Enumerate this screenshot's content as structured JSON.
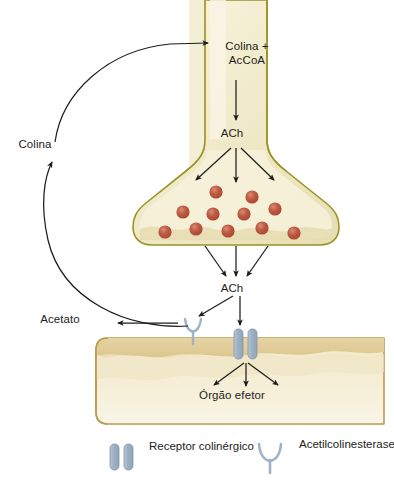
{
  "figure": {
    "language": "pt-BR"
  },
  "labels": {
    "colina_accoa_line1": "Colina +",
    "colina_accoa_line2": "AcCoA",
    "ach_terminal": "ACh",
    "ach_cleft": "ACh",
    "colina": "Colina",
    "acetato": "Acetato",
    "orgao_efetor": "Órgão efetor"
  },
  "legend": {
    "items": [
      {
        "icon": "receptor-bars-icon",
        "label": "Receptor colinérgico"
      },
      {
        "icon": "acetylcholinesterase-icon",
        "label": "Acetilcolinesterase"
      }
    ]
  },
  "colors": {
    "neuron_fill": "#f2eccd",
    "neuron_fill_light": "#faf6e2",
    "neuron_border": "#9a9321",
    "effector_band": "#e3cf9a",
    "effector_fill": "#f0e3c0",
    "effector_border": "#b99c4e",
    "vesicle": "#b5503c",
    "vesicle_highlight": "#d98b73",
    "receptor": "#a3b6c7",
    "receptor_border": "#8aa0b5",
    "ache": "#9fb3c8",
    "arrow": "#1d1d1b",
    "background": "#ffffff"
  },
  "vesicles": [
    {
      "cx": 216,
      "cy": 192
    },
    {
      "cx": 252,
      "cy": 197
    },
    {
      "cx": 183,
      "cy": 212
    },
    {
      "cx": 213,
      "cy": 214
    },
    {
      "cx": 244,
      "cy": 214
    },
    {
      "cx": 275,
      "cy": 209
    },
    {
      "cx": 165,
      "cy": 232
    },
    {
      "cx": 196,
      "cy": 229
    },
    {
      "cx": 228,
      "cy": 231
    },
    {
      "cx": 262,
      "cy": 228
    },
    {
      "cx": 294,
      "cy": 233
    }
  ],
  "receptor_pair": {
    "x": 236,
    "y": 330,
    "bar_width": 8,
    "bar_height": 28,
    "gap": 5
  },
  "acetylcholinesterase": {
    "x": 192,
    "y": 322
  }
}
